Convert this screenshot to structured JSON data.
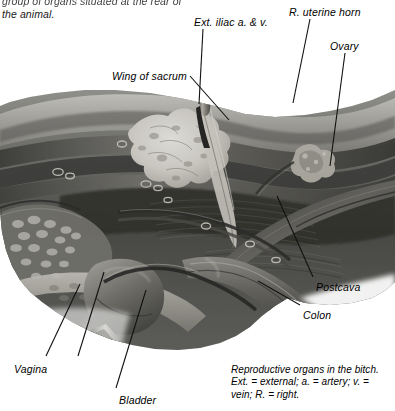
{
  "figure": {
    "kind": "anatomical-photograph",
    "subject": "Reproductive organs in the bitch",
    "rendering": "grayscale halftone photograph",
    "background_color": "#ffffff",
    "ink_color": "#000000"
  },
  "body_text": {
    "line_1": "group of organs situated at the rear of",
    "line_2": "the animal."
  },
  "labels": [
    {
      "id": "ext-iliac",
      "text": "Ext. iliac a. & v.",
      "x": 194,
      "y": 16
    },
    {
      "id": "uterine-horn",
      "text": "R. uterine horn",
      "x": 289,
      "y": 6
    },
    {
      "id": "ovary",
      "text": "Ovary",
      "x": 330,
      "y": 40
    },
    {
      "id": "wing-of-sacrum",
      "text": "Wing of sacrum",
      "x": 112,
      "y": 70
    },
    {
      "id": "postcava",
      "text": "Postcava",
      "x": 316,
      "y": 281
    },
    {
      "id": "colon",
      "text": "Colon",
      "x": 303,
      "y": 309
    },
    {
      "id": "vagina",
      "text": "Vagina",
      "x": 14,
      "y": 363
    },
    {
      "id": "bladder",
      "text": "Bladder",
      "x": 119,
      "y": 394
    }
  ],
  "caption": {
    "line_1": "Reproductive organs in the bitch.",
    "line_2": "Ext. = external; a. = artery; v. =",
    "line_3": "vein; R. = right."
  },
  "colors": {
    "page_background": "#ffffff",
    "text": "#000000",
    "leader_line": "#111111",
    "plate_dark": "#1c1c1c",
    "plate_mid": "#6a6a6a",
    "plate_light": "#c9c9c4",
    "bone_highlight": "#f2f1ec"
  }
}
